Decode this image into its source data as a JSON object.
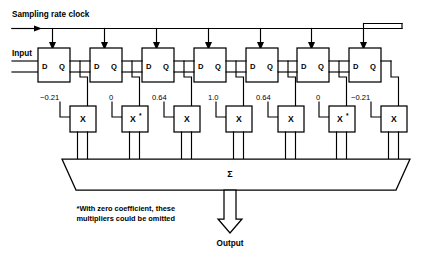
{
  "diagram": {
    "clock_label": "Sampling rate clock",
    "input_label": "Input",
    "output_label": "Output",
    "sum_symbol": "Σ",
    "footnote_line1": "*With zero coefficient, these",
    "footnote_line2": "multipliers could be omitted",
    "multiplier_symbol": "X",
    "star_symbol": "*",
    "port_d": "D",
    "port_q": "Q",
    "colors": {
      "line": "#000000",
      "background": "#ffffff",
      "text": "#000000"
    },
    "taps": [
      {
        "index": 1,
        "coefficient": "−0.21",
        "coefficient_value": -0.21,
        "starred": false
      },
      {
        "index": 2,
        "coefficient": "0",
        "coefficient_value": 0,
        "starred": true
      },
      {
        "index": 3,
        "coefficient": "0.64",
        "coefficient_value": 0.64,
        "starred": false
      },
      {
        "index": 4,
        "coefficient": "1.0",
        "coefficient_value": 1.0,
        "starred": false
      },
      {
        "index": 5,
        "coefficient": "0.64",
        "coefficient_value": 0.64,
        "starred": false
      },
      {
        "index": 6,
        "coefficient": "0",
        "coefficient_value": 0,
        "starred": true
      },
      {
        "index": 7,
        "coefficient": "−0.21",
        "coefficient_value": -0.21,
        "starred": false
      }
    ]
  }
}
